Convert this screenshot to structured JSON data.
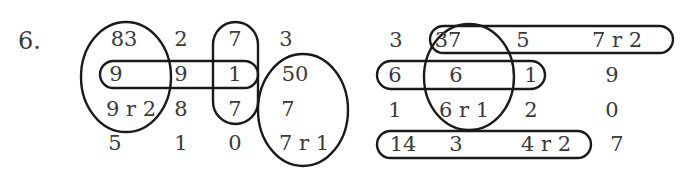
{
  "problem": {
    "number_label": "6.",
    "left_grid": {
      "rows": [
        [
          "83",
          "2",
          "7",
          "3"
        ],
        [
          "9",
          "9",
          "1",
          "50"
        ],
        [
          "9 r 2",
          "8",
          "7",
          "7"
        ],
        [
          "5",
          "1",
          "0",
          "7 r 1"
        ]
      ]
    },
    "right_grid": {
      "rows": [
        [
          "3",
          "37",
          "5",
          "7 r 2"
        ],
        [
          "6",
          "6",
          "1",
          "9"
        ],
        [
          "1",
          "6 r 1",
          "2",
          "0"
        ],
        [
          "14",
          "3",
          "4 r 2",
          "7"
        ]
      ]
    },
    "line_color": "#1a1a1a",
    "text_color": "#3a3a3a"
  }
}
